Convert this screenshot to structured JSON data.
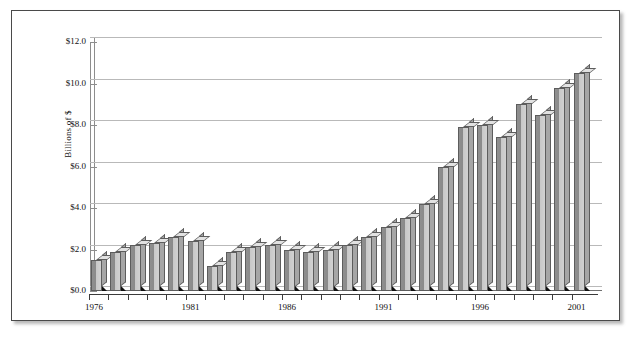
{
  "figure": {
    "y_axis_title": "Billions of $"
  },
  "chart_data": {
    "type": "bar",
    "title": "",
    "subtitle": "",
    "xlabel": "",
    "ylabel": "Billions of $",
    "ylim": [
      0.0,
      12.0
    ],
    "ytick_labels": [
      "$0.0",
      "$2.0",
      "$4.0",
      "$6.0",
      "$8.0",
      "$10.0",
      "$12.0"
    ],
    "ytick_values": [
      0.0,
      2.0,
      4.0,
      6.0,
      8.0,
      10.0,
      12.0
    ],
    "grid": true,
    "legend": "none",
    "style": "3d-column",
    "xtick_labels": [
      "1976",
      "1981",
      "1986",
      "1991",
      "1996",
      "2001"
    ],
    "xtick_label_years": [
      1976,
      1981,
      1986,
      1991,
      1996,
      2001
    ],
    "categories": [
      "1976",
      "1977",
      "1978",
      "1979",
      "1980",
      "1981",
      "1982",
      "1983",
      "1984",
      "1985",
      "1986",
      "1987",
      "1988",
      "1989",
      "1990",
      "1991",
      "1992",
      "1993",
      "1994",
      "1995",
      "1996",
      "1997",
      "1998",
      "1999",
      "2000",
      "2001"
    ],
    "values": [
      1.5,
      1.9,
      2.2,
      2.3,
      2.6,
      2.4,
      1.2,
      1.9,
      2.1,
      2.2,
      2.0,
      1.9,
      2.0,
      2.2,
      2.6,
      3.1,
      3.5,
      4.2,
      6.0,
      7.9,
      8.0,
      7.4,
      9.0,
      8.5,
      9.8,
      10.5
    ],
    "bar_values_by_year": [
      {
        "year": "1976",
        "value": 1.5
      },
      {
        "year": "1977",
        "value": 1.9
      },
      {
        "year": "1978",
        "value": 2.2
      },
      {
        "year": "1979",
        "value": 2.3
      },
      {
        "year": "1980",
        "value": 2.6
      },
      {
        "year": "1981",
        "value": 2.4
      },
      {
        "year": "1982",
        "value": 1.2
      },
      {
        "year": "1983",
        "value": 1.9
      },
      {
        "year": "1984",
        "value": 2.1
      },
      {
        "year": "1985",
        "value": 2.2
      },
      {
        "year": "1986",
        "value": 2.0
      },
      {
        "year": "1987",
        "value": 1.9
      },
      {
        "year": "1988",
        "value": 2.0
      },
      {
        "year": "1989",
        "value": 2.2
      },
      {
        "year": "1990",
        "value": 2.6
      },
      {
        "year": "1991",
        "value": 3.1
      },
      {
        "year": "1992",
        "value": 3.5
      },
      {
        "year": "1993",
        "value": 4.2
      },
      {
        "year": "1994",
        "value": 6.0
      },
      {
        "year": "1995",
        "value": 7.9
      },
      {
        "year": "1996",
        "value": 8.0
      },
      {
        "year": "1997",
        "value": 7.4
      },
      {
        "year": "1998",
        "value": 9.0
      },
      {
        "year": "1999",
        "value": 8.5
      },
      {
        "year": "2000",
        "value": 9.8
      },
      {
        "year": "2001",
        "value": 10.5
      }
    ],
    "colors": {
      "bar_front_dark": "#8a8a8a",
      "bar_front_light": "#d2d2d2",
      "bar_side": "#a6a6a6",
      "bar_top": "#e2e2e2",
      "bar_outline": "#5d5d5d",
      "gridline": "#b9b9b9",
      "axis": "#3b3b3b",
      "frame": "#4a4a4a",
      "background": "#ffffff",
      "text": "#111111"
    }
  }
}
